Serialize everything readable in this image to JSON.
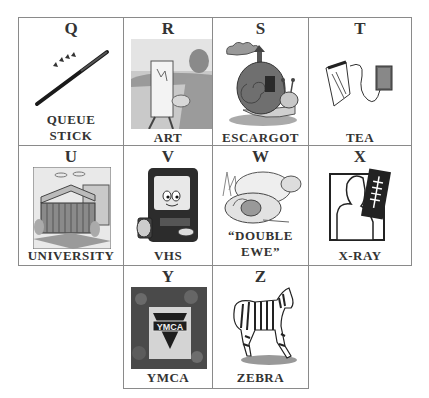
{
  "cards": [
    {
      "letter": "Q",
      "caption_line1": "QUEUE",
      "caption_line2": "STICK",
      "image": "queue-stick-icon"
    },
    {
      "letter": "R",
      "caption_line1": "ART",
      "image": "artist-painting-icon"
    },
    {
      "letter": "S",
      "caption_line1": "ESCARGOT",
      "image": "snail-icon"
    },
    {
      "letter": "T",
      "caption_line1": "TEA",
      "image": "tea-bag-icon"
    },
    {
      "letter": "U",
      "caption_line1": "UNIVERSITY",
      "image": "university-building-icon"
    },
    {
      "letter": "V",
      "caption_line1": "VHS",
      "image": "tv-vhs-icon"
    },
    {
      "letter": "W",
      "caption_line1": "“DOUBLE",
      "caption_line2": "EWE”",
      "image": "sheep-icon"
    },
    {
      "letter": "X",
      "caption_line1": "X-RAY",
      "image": "xray-icon"
    },
    {
      "letter": "Y",
      "caption_line1": "YMCA",
      "image": "ymca-sign-icon"
    },
    {
      "letter": "Z",
      "caption_line1": "ZEBRA",
      "image": "zebra-icon"
    }
  ]
}
